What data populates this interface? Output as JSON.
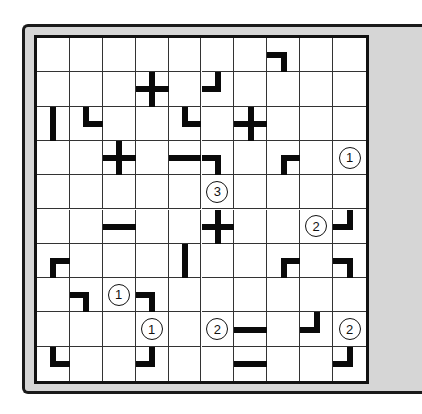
{
  "puzzle": {
    "rows": 10,
    "cols": 10,
    "colors": {
      "frame": "#d6d6d6",
      "board": "#ffffff",
      "line": "#0a0a0a"
    },
    "segments": [
      {
        "r": 0,
        "c": 7,
        "dirs": [
          "W",
          "S"
        ]
      },
      {
        "r": 1,
        "c": 3,
        "dirs": [
          "N",
          "E",
          "S",
          "W"
        ]
      },
      {
        "r": 1,
        "c": 5,
        "dirs": [
          "N",
          "W"
        ]
      },
      {
        "r": 2,
        "c": 0,
        "dirs": [
          "N",
          "S"
        ]
      },
      {
        "r": 2,
        "c": 1,
        "dirs": [
          "N",
          "E"
        ]
      },
      {
        "r": 2,
        "c": 4,
        "dirs": [
          "N",
          "E"
        ]
      },
      {
        "r": 2,
        "c": 6,
        "dirs": [
          "N",
          "E",
          "S",
          "W"
        ]
      },
      {
        "r": 3,
        "c": 2,
        "dirs": [
          "N",
          "E",
          "S",
          "W"
        ]
      },
      {
        "r": 3,
        "c": 4,
        "dirs": [
          "W",
          "E"
        ]
      },
      {
        "r": 3,
        "c": 5,
        "dirs": [
          "W",
          "S"
        ]
      },
      {
        "r": 3,
        "c": 7,
        "dirs": [
          "S",
          "E"
        ]
      },
      {
        "r": 5,
        "c": 2,
        "dirs": [
          "W",
          "E"
        ]
      },
      {
        "r": 5,
        "c": 5,
        "dirs": [
          "N",
          "E",
          "S",
          "W"
        ]
      },
      {
        "r": 5,
        "c": 9,
        "dirs": [
          "N",
          "W"
        ]
      },
      {
        "r": 6,
        "c": 0,
        "dirs": [
          "S",
          "E"
        ]
      },
      {
        "r": 6,
        "c": 4,
        "dirs": [
          "N",
          "S"
        ]
      },
      {
        "r": 6,
        "c": 7,
        "dirs": [
          "S",
          "E"
        ]
      },
      {
        "r": 6,
        "c": 9,
        "dirs": [
          "W",
          "S"
        ]
      },
      {
        "r": 7,
        "c": 1,
        "dirs": [
          "W",
          "S"
        ]
      },
      {
        "r": 7,
        "c": 3,
        "dirs": [
          "W",
          "S"
        ]
      },
      {
        "r": 8,
        "c": 6,
        "dirs": [
          "W",
          "E"
        ]
      },
      {
        "r": 8,
        "c": 8,
        "dirs": [
          "N",
          "W"
        ]
      },
      {
        "r": 9,
        "c": 0,
        "dirs": [
          "N",
          "E"
        ]
      },
      {
        "r": 9,
        "c": 3,
        "dirs": [
          "N",
          "W"
        ]
      },
      {
        "r": 9,
        "c": 6,
        "dirs": [
          "W",
          "E"
        ]
      },
      {
        "r": 9,
        "c": 9,
        "dirs": [
          "N",
          "W"
        ]
      }
    ],
    "clues": [
      {
        "r": 3,
        "c": 9,
        "value": "1"
      },
      {
        "r": 4,
        "c": 5,
        "value": "3"
      },
      {
        "r": 5,
        "c": 8,
        "value": "2"
      },
      {
        "r": 7,
        "c": 2,
        "value": "1"
      },
      {
        "r": 8,
        "c": 3,
        "value": "1"
      },
      {
        "r": 8,
        "c": 5,
        "value": "2"
      },
      {
        "r": 8,
        "c": 9,
        "value": "2"
      }
    ]
  }
}
